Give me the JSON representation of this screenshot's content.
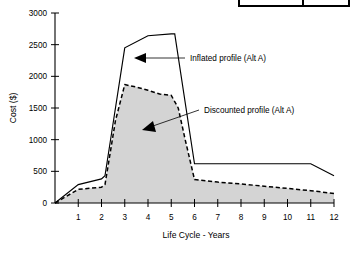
{
  "chart_data": {
    "type": "area",
    "title": "",
    "xlabel": "Life Cycle - Years",
    "ylabel": "Cost ($)",
    "xlim": [
      0,
      12
    ],
    "ylim": [
      0,
      3000
    ],
    "grid": false,
    "legend_position": "inline-annotations",
    "x_ticks": [
      "1",
      "2",
      "3",
      "4",
      "5",
      "6",
      "7",
      "8",
      "9",
      "10",
      "11",
      "12"
    ],
    "x_tick_values": [
      1,
      2,
      3,
      4,
      5,
      6,
      7,
      8,
      9,
      10,
      11,
      12
    ],
    "y_ticks": [
      "0",
      "500",
      "1000",
      "1500",
      "2000",
      "2500",
      "3000"
    ],
    "y_tick_values": [
      0,
      500,
      1000,
      1500,
      2000,
      2500,
      3000
    ],
    "series": [
      {
        "name": "Inflated profile (Alt A)",
        "style": "solid",
        "filled": false,
        "color": "#000000",
        "x": [
          0,
          1,
          2,
          2.15,
          3,
          4,
          5,
          5.15,
          6,
          11,
          12
        ],
        "values": [
          0,
          290,
          380,
          430,
          2450,
          2640,
          2670,
          2670,
          620,
          620,
          430
        ]
      },
      {
        "name": "Discounted profile (Alt A)",
        "style": "dashed",
        "filled": true,
        "fill_color": "#d4d4d4",
        "color": "#000000",
        "x": [
          0,
          1,
          2,
          2.15,
          2.6,
          3,
          3.5,
          4,
          4.5,
          5,
          5.3,
          5.6,
          6,
          7,
          8,
          9,
          10,
          11,
          12
        ],
        "values": [
          0,
          215,
          250,
          290,
          1300,
          1870,
          1830,
          1780,
          1720,
          1700,
          1500,
          1000,
          370,
          330,
          300,
          265,
          230,
          195,
          150
        ]
      }
    ],
    "annotations": [
      {
        "label": "Inflated profile (Alt A)",
        "points_to_series": "Inflated profile (Alt A)"
      },
      {
        "label": "Discounted profile (Alt A)",
        "points_to_series": "Discounted profile (Alt A)"
      }
    ]
  },
  "axes": {
    "y_title": "Cost ($)",
    "x_title": "Life Cycle - Years"
  },
  "annotations": {
    "inflated_label": "Inflated profile (Alt A)",
    "discounted_label": "Discounted profile (Alt A)"
  },
  "colors": {
    "line": "#000000",
    "fill": "#d4d4d4",
    "background": "#ffffff"
  }
}
